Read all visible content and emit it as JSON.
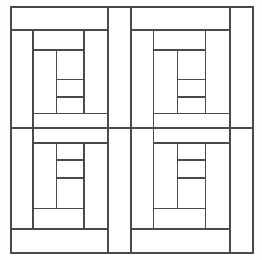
{
  "figure": {
    "type": "line-diagram",
    "width": 262,
    "height": 260,
    "background_color": "#fefefe",
    "line_color": "#4a4a4a",
    "line_width": 1.6,
    "fill_color": "#ffffff"
  },
  "diagram_data": {
    "type": "patchwork-grid",
    "description": "Four log cabin quilt blocks arranged in a two by two grid; the lower two blocks are vertical mirror images of the upper two.",
    "outer_frame": {
      "x": 11,
      "y": 7,
      "width": 242,
      "height": 246
    },
    "grid": {
      "rows": 2,
      "cols": 2,
      "split_x": 131,
      "split_y": 128
    },
    "blocks": [
      {
        "name": "top-left-block",
        "row": 0,
        "col": 0,
        "orientation": "normal",
        "bounds": {
          "x": 11,
          "y": 7,
          "width": 120,
          "height": 121
        }
      },
      {
        "name": "top-right-block",
        "row": 0,
        "col": 1,
        "orientation": "normal",
        "bounds": {
          "x": 131,
          "y": 7,
          "width": 122,
          "height": 121
        }
      },
      {
        "name": "bottom-left-block",
        "row": 1,
        "col": 0,
        "orientation": "mirrored-vertical",
        "bounds": {
          "x": 11,
          "y": 128,
          "width": 120,
          "height": 125
        }
      },
      {
        "name": "bottom-right-block",
        "row": 1,
        "col": 1,
        "orientation": "mirrored-vertical",
        "bounds": {
          "x": 131,
          "y": 128,
          "width": 122,
          "height": 125
        }
      }
    ],
    "block_template": {
      "description": "Normalised 0..1 coordinates of the log strips inside one block.",
      "vertical_divisions": [
        0.0,
        0.185,
        0.61,
        0.81,
        1.0
      ],
      "horizontal_divisions": [
        0.0,
        0.19,
        0.355,
        0.6,
        0.745,
        0.88,
        1.0
      ],
      "logs": [
        {
          "name": "top-strip",
          "x0": 0.0,
          "y0": 0.0,
          "x1": 0.81,
          "y1": 0.19
        },
        {
          "name": "right-strip",
          "x0": 0.81,
          "y0": 0.0,
          "x1": 1.0,
          "y1": 1.0
        },
        {
          "name": "left-strip",
          "x0": 0.0,
          "y0": 0.19,
          "x1": 0.185,
          "y1": 1.0
        },
        {
          "name": "bottom-strip",
          "x0": 0.185,
          "y0": 0.88,
          "x1": 0.81,
          "y1": 1.0
        },
        {
          "name": "inner-right",
          "x0": 0.61,
          "y0": 0.19,
          "x1": 0.81,
          "y1": 0.88
        },
        {
          "name": "inner-top",
          "x0": 0.185,
          "y0": 0.19,
          "x1": 0.61,
          "y1": 0.355
        },
        {
          "name": "inner-left",
          "x0": 0.185,
          "y0": 0.355,
          "x1": 0.38,
          "y1": 0.88
        },
        {
          "name": "inner-bottom",
          "x0": 0.38,
          "y0": 0.745,
          "x1": 0.61,
          "y1": 0.88
        },
        {
          "name": "core-upper",
          "x0": 0.38,
          "y0": 0.355,
          "x1": 0.61,
          "y1": 0.6
        },
        {
          "name": "core-lower",
          "x0": 0.38,
          "y0": 0.6,
          "x1": 0.61,
          "y1": 0.745
        }
      ]
    }
  }
}
